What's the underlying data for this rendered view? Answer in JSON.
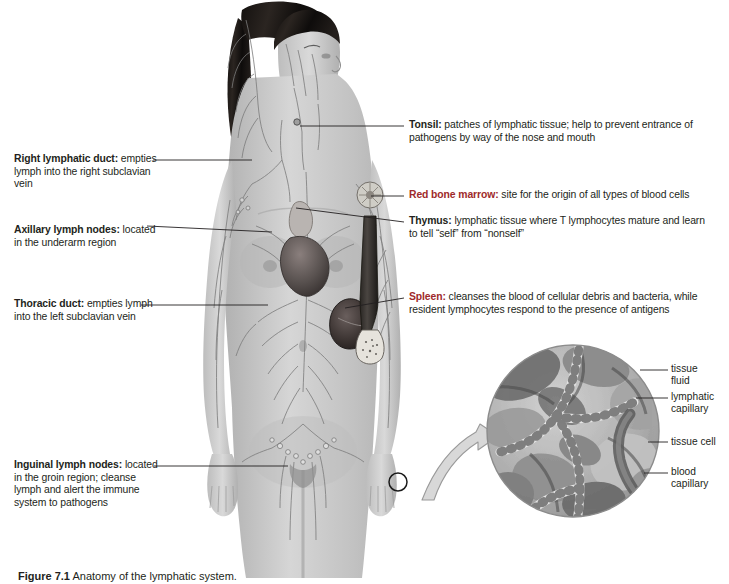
{
  "figure": {
    "title": "Anatomy of the lymphatic system",
    "caption_number": "Figure 7.1",
    "caption_text": "Anatomy of the lymphatic system.",
    "colors": {
      "background": "#ffffff",
      "text": "#231f20",
      "term_highlight": "#9e2a2b",
      "leader_line": "#231f20",
      "arrow_fill": "#d8d8d8",
      "arrow_stroke": "#9a9a9a"
    }
  },
  "callouts_left": [
    {
      "id": "right-lymphatic-duct",
      "term": "Right lymphatic duct:",
      "term_color": "dark",
      "description": "empties lymph into the right subclavian vein"
    },
    {
      "id": "axillary-lymph-nodes",
      "term": "Axillary lymph nodes:",
      "term_color": "dark",
      "description": "located in the underarm region"
    },
    {
      "id": "thoracic-duct",
      "term": "Thoracic duct:",
      "term_color": "dark",
      "description": "empties lymph into the left subclavian vein"
    },
    {
      "id": "inguinal-lymph-nodes",
      "term": "Inguinal lymph nodes:",
      "term_color": "dark",
      "description": "located in the groin region; cleanse lymph and alert the immune system to pathogens"
    }
  ],
  "callouts_right": [
    {
      "id": "tonsil",
      "term": "Tonsil:",
      "term_color": "dark",
      "description": "patches of lymphatic tissue; help to prevent entrance of pathogens by way of the nose and mouth"
    },
    {
      "id": "red-bone-marrow",
      "term": "Red bone marrow:",
      "term_color": "red",
      "description": "site for the origin of all types of blood cells"
    },
    {
      "id": "thymus",
      "term": "Thymus:",
      "term_color": "dark",
      "description": "lymphatic tissue where T lymphocytes mature and learn to tell “self” from “nonself”"
    },
    {
      "id": "spleen",
      "term": "Spleen:",
      "term_color": "red",
      "description": "cleanses the blood of cellular debris and bacteria, while resident lymphocytes respond to the presence of antigens"
    }
  ],
  "inset": {
    "id": "lymphatic-capillary-detail",
    "description": "circular magnified view of lymphatic capillaries among tissue cells",
    "labels": [
      {
        "id": "tissue-fluid",
        "line1": "tissue",
        "line2": "fluid"
      },
      {
        "id": "lymphatic-capillary",
        "line1": "lymphatic",
        "line2": "capillary"
      },
      {
        "id": "tissue-cell",
        "line1": "tissue cell",
        "line2": ""
      },
      {
        "id": "blood-capillary",
        "line1": "blood",
        "line2": "capillary"
      }
    ]
  }
}
